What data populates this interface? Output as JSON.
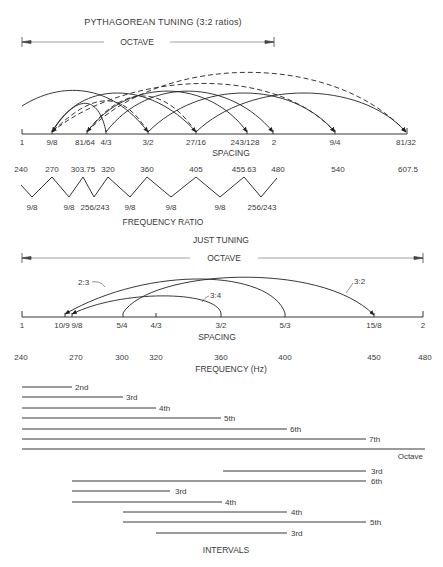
{
  "pythagorean": {
    "title": "PYTHAGOREAN TUNING (3:2 ratios)",
    "octave_label": "OCTAVE",
    "spacing_label": "SPACING",
    "ticks": [
      {
        "label": "1",
        "x": 22
      },
      {
        "label": "9/8",
        "x": 52
      },
      {
        "label": "81/64",
        "x": 87
      },
      {
        "label": "4/3",
        "x": 106
      },
      {
        "label": "3/2",
        "x": 148
      },
      {
        "label": "27/16",
        "x": 196
      },
      {
        "label": "243/128",
        "x": 247
      },
      {
        "label": "2",
        "x": 273
      },
      {
        "label": "9/4",
        "x": 335
      },
      {
        "label": "81/32",
        "x": 406
      }
    ],
    "arcs": [
      {
        "from": "1",
        "to": "3/2",
        "style": "solid"
      },
      {
        "from": "4/3",
        "to": "9/8",
        "style": "solid"
      },
      {
        "from": "9/8",
        "to": "27/16",
        "style": "solid"
      },
      {
        "from": "3/2",
        "to": "9/8",
        "style": "dashed"
      },
      {
        "from": "4/3",
        "to": "2",
        "style": "solid"
      },
      {
        "from": "3/2",
        "to": "9/4",
        "style": "solid"
      },
      {
        "from": "27/16",
        "to": "81/64",
        "style": "dashed"
      },
      {
        "from": "81/64",
        "to": "243/128",
        "style": "solid"
      },
      {
        "from": "27/16",
        "to": "81/32",
        "style": "solid"
      },
      {
        "from": "9/8",
        "to": "9/4",
        "style": "dashed"
      },
      {
        "from": "81/64",
        "to": "81/32",
        "style": "dashed"
      }
    ],
    "frequencies": [
      "240",
      "270",
      "303.75",
      "320",
      "360",
      "405",
      "455.63",
      "480",
      "540",
      "607.5"
    ],
    "step_ratios": [
      "9/8",
      "9/8",
      "256/243",
      "9/8",
      "9/8",
      "9/8",
      "256/243"
    ],
    "frequency_ratio_label": "FREQUENCY RATIO"
  },
  "just": {
    "title": "JUST TUNING",
    "octave_label": "OCTAVE",
    "spacing_label": "SPACING",
    "frequency_label": "FREQUENCY (Hz)",
    "ticks": [
      {
        "label": "1",
        "x": 22,
        "freq": "240"
      },
      {
        "label": "10/9",
        "x": 65,
        "freq": ""
      },
      {
        "label": "9/8",
        "x": 72,
        "freq": "270"
      },
      {
        "label": "5/4",
        "x": 123,
        "freq": "300"
      },
      {
        "label": "4/3",
        "x": 156,
        "freq": "320"
      },
      {
        "label": "3/2",
        "x": 221,
        "freq": "360"
      },
      {
        "label": "5/3",
        "x": 285,
        "freq": "400"
      },
      {
        "label": "15/8",
        "x": 374,
        "freq": "450"
      },
      {
        "label": "2",
        "x": 423,
        "freq": "480"
      }
    ],
    "arc_labels": [
      "2:3",
      "3:4",
      "3:2"
    ]
  },
  "intervals": {
    "title": "INTERVALS",
    "bars": [
      {
        "label": "2nd",
        "x1": 22,
        "x2": 72,
        "y": 387
      },
      {
        "label": "3rd",
        "x1": 22,
        "x2": 123,
        "y": 397
      },
      {
        "label": "4th",
        "x1": 22,
        "x2": 156,
        "y": 408
      },
      {
        "label": "5th",
        "x1": 22,
        "x2": 221,
        "y": 418
      },
      {
        "label": "6th",
        "x1": 22,
        "x2": 285,
        "y": 429
      },
      {
        "label": "7th",
        "x1": 22,
        "x2": 366,
        "y": 439
      },
      {
        "label": "Octave",
        "x1": 22,
        "x2": 425,
        "y": 449
      },
      {
        "label": "3rd",
        "x1": 223,
        "x2": 366,
        "y": 471
      },
      {
        "label": "6th",
        "x1": 72,
        "x2": 366,
        "y": 481
      },
      {
        "label": "3rd",
        "x1": 72,
        "x2": 170,
        "y": 491
      },
      {
        "label": "4th",
        "x1": 72,
        "x2": 222,
        "y": 502
      },
      {
        "label": "4th",
        "x1": 123,
        "x2": 287,
        "y": 512
      },
      {
        "label": "5th",
        "x1": 123,
        "x2": 366,
        "y": 522
      },
      {
        "label": "3rd",
        "x1": 156,
        "x2": 287,
        "y": 533
      }
    ]
  }
}
